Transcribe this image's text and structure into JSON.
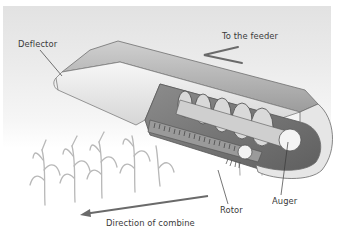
{
  "diagram": {
    "labels": {
      "deflector": "Deflector",
      "to_feeder": "To the feeder",
      "rotor": "Rotor",
      "auger": "Auger",
      "direction": "Direction of combine"
    },
    "icons": {
      "feeder_arrow": "arrow-right-up",
      "direction_arrow": "arrow-left"
    },
    "colors": {
      "background_top": "#e2e2e2",
      "background_bottom": "#ffffff",
      "housing": "#b9b9b9",
      "housing_light": "#efefef",
      "housing_dark": "#7a7a7a",
      "arrow": "#6a6a6a",
      "text": "#3a3a3a",
      "plants": "#b5b5b5"
    }
  }
}
